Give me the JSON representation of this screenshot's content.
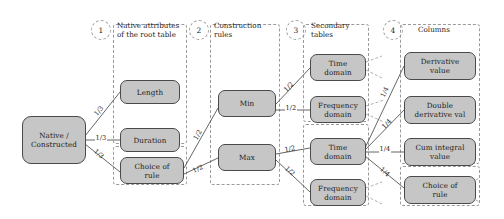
{
  "diagram": {
    "node_fill": "#c6c6c6",
    "node_stroke": "#4a4a4a",
    "edge_color": "#555555",
    "dashed_color": "#9a9a9a",
    "columns": [
      {
        "number": "1",
        "title": "Native attributes\nof the root table"
      },
      {
        "number": "2",
        "title": "Construction\nrules"
      },
      {
        "number": "3",
        "title": "Secondary\ntables"
      },
      {
        "number": "4",
        "title": "Columns"
      }
    ],
    "nodes": [
      {
        "id": "root",
        "label": "Native /\nConstructed"
      },
      {
        "id": "length",
        "label": "Length"
      },
      {
        "id": "duration",
        "label": "Duration"
      },
      {
        "id": "choice_rule_1",
        "label": "Choice of\nrule"
      },
      {
        "id": "min",
        "label": "Min"
      },
      {
        "id": "max",
        "label": "Max"
      },
      {
        "id": "time_domain_1",
        "label": "Time\ndomain"
      },
      {
        "id": "freq_domain_1",
        "label": "Frequency\ndomain"
      },
      {
        "id": "time_domain_2",
        "label": "Time\ndomain"
      },
      {
        "id": "freq_domain_2",
        "label": "Frequency\ndomain"
      },
      {
        "id": "derivative_value",
        "label": "Derivative\nvalue"
      },
      {
        "id": "double_derivative",
        "label": "Double\nderivative val"
      },
      {
        "id": "cum_integral",
        "label": "Cum integral\nvalue"
      },
      {
        "id": "choice_rule_2",
        "label": "Choice of\nrule"
      }
    ],
    "edges": [
      {
        "from": "root",
        "to": "length",
        "label": "1/3"
      },
      {
        "from": "root",
        "to": "duration",
        "label": "1/3"
      },
      {
        "from": "root",
        "to": "choice_rule_1",
        "label": "1/3"
      },
      {
        "from": "choice_rule_1",
        "to": "min",
        "label": "1/2"
      },
      {
        "from": "choice_rule_1",
        "to": "max",
        "label": "1/2"
      },
      {
        "from": "min",
        "to": "time_domain_1",
        "label": "1/2"
      },
      {
        "from": "min",
        "to": "freq_domain_1",
        "label": "1/2"
      },
      {
        "from": "max",
        "to": "time_domain_2",
        "label": "1/2"
      },
      {
        "from": "max",
        "to": "freq_domain_2",
        "label": "1/2"
      },
      {
        "from": "time_domain_2",
        "to": "derivative_value",
        "label": "1/4"
      },
      {
        "from": "time_domain_2",
        "to": "double_derivative",
        "label": "1/4"
      },
      {
        "from": "time_domain_2",
        "to": "cum_integral",
        "label": "1/4"
      },
      {
        "from": "time_domain_2",
        "to": "choice_rule_2",
        "label": "1/4"
      }
    ]
  }
}
